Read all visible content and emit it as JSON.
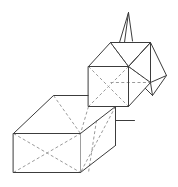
{
  "figure": {
    "background_color": "#ffffff",
    "solid_line_color": "#3c3c3c",
    "hidden_line_color": "#9a9a9a",
    "line_width": 1,
    "dash_pattern": "3 2.4",
    "canvas": {
      "width": 178,
      "height": 187
    },
    "parts": [
      {
        "name": "spike-pyramid",
        "label": "Narrow pyramid spike"
      },
      {
        "name": "cube",
        "label": "Cube"
      },
      {
        "name": "right-flap",
        "label": "Right unfolded flap"
      },
      {
        "name": "connector-prism",
        "label": "Slanted connector prism"
      },
      {
        "name": "cuboid",
        "label": "Rectangular cuboid"
      }
    ]
  },
  "geometry": {
    "spike_pyramid": {
      "solid_paths": [
        "M 128.5 12.5 L 119.5 42.5",
        "M 128.5 12.5 L 124.5 42.5",
        "M 128.5 12.5 L 132.5 41.0"
      ],
      "hidden_paths": []
    },
    "cube": {
      "solid_paths": [
        "M 88.5 66.5 L 128.5 66.5 L 128.5 106.5 L 88.5 106.5 Z",
        "M 88.5 66.5 L 110.5 42.5 L 150.5 42.5 L 128.5 66.5",
        "M 150.5 42.5 L 150.5 82.5 L 128.5 106.5",
        "M 110.5 42.5 L 128.5 66.5",
        "M 128.5 66.5 L 150.5 42.5",
        "M 128.5 66.5 L 150.5 82.5"
      ],
      "hidden_paths": [
        "M 110.5 42.5 L 128.5 66.5",
        "M 88.5 66.5 L 128.5 106.5",
        "M 128.5 66.5 L 88.5 106.5",
        "M 128.5 66.5 L 150.5 82.5",
        "M 128.5 66.5 L 128.5 106.5"
      ]
    },
    "right_flap": {
      "solid_paths": [
        "M 150.5 42.5 L 166.5 75.5 L 152.5 95.5 L 136.5 79.5",
        "M 150.5 82.5 L 152.5 95.5",
        "M 150.5 42.5 L 136.5 79.5",
        "M 150.5 82.5 L 166.5 75.5"
      ],
      "hidden_paths": [
        "M 128.5 66.5 L 150.5 42.5"
      ]
    },
    "connector_prism": {
      "solid_paths": [
        "M 88.5 106.5 L 115.5 106.5 L 115.5 120.5 L 134.5 120.5",
        "M 80.5 133.5 L 115.5 106.5",
        "M 80.5 172.5 L 115.5 145.5",
        "M 115.5 106.5 L 115.5 145.5"
      ],
      "hidden_paths": [
        "M 88.5 106.5 L 80.5 133.5",
        "M 115.5 106.5 L 80.5 172.5",
        "M 96.5 120.5 L 88.5 172.5"
      ]
    },
    "cuboid": {
      "solid_paths": [
        "M 13.5 133.5 L 80.5 133.5 L 80.5 172.5 L 13.5 172.5 Z",
        "M 13.5 133.5 L 53.5 95.5 L 115.5 95.5",
        "M 53.5 95.5 L 80.5 133.5"
      ],
      "hidden_paths": [
        "M 53.5 95.5 L 80.5 133.5",
        "M 13.5 172.5 L 80.5 133.5",
        "M 13.5 133.5 L 80.5 172.5"
      ]
    }
  }
}
